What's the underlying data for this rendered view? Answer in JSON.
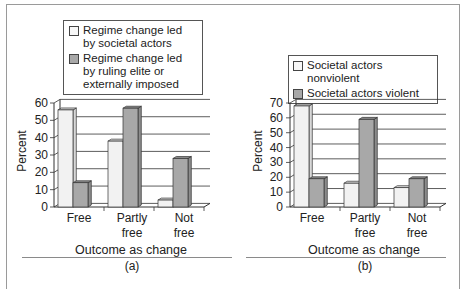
{
  "colors": {
    "light_bar": "#f2f2f2",
    "light_bar_side": "#d8d8d8",
    "dark_bar": "#a8a8a8",
    "dark_bar_side": "#8c8c8c",
    "grid": "#333333"
  },
  "chart_data": [
    {
      "type": "bar",
      "panel_label": "(a)",
      "title": "",
      "xlabel": "Outcome as change",
      "ylabel": "Percent",
      "ylim": [
        0,
        60
      ],
      "yticks": [
        0,
        10,
        20,
        30,
        40,
        50,
        60
      ],
      "grid": true,
      "legend_position": "top",
      "categories": [
        "Free",
        "Partly free",
        "Not free"
      ],
      "series": [
        {
          "name": "Regime change led by societal actors",
          "values": [
            56,
            38,
            4
          ]
        },
        {
          "name": "Regime change led by ruling elite or externally imposed",
          "values": [
            14,
            57,
            28
          ]
        }
      ]
    },
    {
      "type": "bar",
      "panel_label": "(b)",
      "title": "",
      "xlabel": "Outcome as change",
      "ylabel": "Percent",
      "ylim": [
        0,
        70
      ],
      "yticks": [
        0,
        10,
        20,
        30,
        40,
        50,
        60,
        70
      ],
      "grid": true,
      "legend_position": "top",
      "categories": [
        "Free",
        "Partly free",
        "Not free"
      ],
      "series": [
        {
          "name": "Societal actors nonviolent",
          "values": [
            68,
            16,
            13
          ]
        },
        {
          "name": "Societal actors violent",
          "values": [
            19,
            59,
            19
          ]
        }
      ]
    }
  ],
  "labels": {
    "a": {
      "legend": [
        "Regime change led by societal actors",
        "Regime change led by ruling elite or externally imposed"
      ],
      "cat_lines": [
        [
          "Free",
          ""
        ],
        [
          "Partly",
          "free"
        ],
        [
          "Not",
          "free"
        ]
      ],
      "xlabel": "Outcome as change",
      "ylabel": "Percent",
      "panel": "(a)"
    },
    "b": {
      "legend": [
        "Societal actors nonviolent",
        "Societal actors violent"
      ],
      "cat_lines": [
        [
          "Free",
          ""
        ],
        [
          "Partly",
          "free"
        ],
        [
          "Not",
          "free"
        ]
      ],
      "xlabel": "Outcome as change",
      "ylabel": "Percent",
      "panel": "(b)"
    }
  }
}
